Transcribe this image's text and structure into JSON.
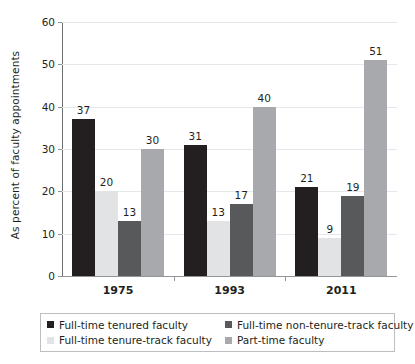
{
  "chart_data": {
    "type": "bar",
    "title": "",
    "subtitle": "",
    "xlabel": "",
    "ylabel": "As percent of faculty appointments",
    "ylim": [
      0,
      60
    ],
    "yticks": [
      0,
      10,
      20,
      30,
      40,
      50,
      60
    ],
    "ytick_labels": [
      "0",
      "10",
      "20",
      "30",
      "40",
      "50",
      "60"
    ],
    "grid": true,
    "grid_axis": "y",
    "legend_position": "bottom",
    "categories": [
      "1975",
      "1993",
      "2011"
    ],
    "series": [
      {
        "name": "Full-time tenured faculty",
        "color": "#231f20",
        "values": [
          37,
          31,
          21
        ],
        "value_labels": [
          "37",
          "31",
          "21"
        ]
      },
      {
        "name": "Full-time tenure-track faculty",
        "color": "#e2e3e4",
        "values": [
          20,
          13,
          9
        ],
        "value_labels": [
          "20",
          "13",
          "9"
        ]
      },
      {
        "name": "Full-time non-tenure-track faculty",
        "color": "#58595b",
        "values": [
          13,
          17,
          19
        ],
        "value_labels": [
          "13",
          "17",
          "19"
        ]
      },
      {
        "name": "Part-time faculty",
        "color": "#a7a9ac",
        "values": [
          30,
          40,
          51
        ],
        "value_labels": [
          "30",
          "40",
          "51"
        ]
      }
    ]
  },
  "legend": {
    "entries": [
      {
        "label": "Full-time tenured faculty",
        "color": "#231f20"
      },
      {
        "label": "Full-time non-tenure-track faculty",
        "color": "#58595b"
      },
      {
        "label": "Full-time tenure-track faculty",
        "color": "#e2e3e4"
      },
      {
        "label": "Part-time faculty",
        "color": "#a7a9ac"
      }
    ]
  },
  "axis": {
    "y_title": "As percent of faculty appointments"
  }
}
